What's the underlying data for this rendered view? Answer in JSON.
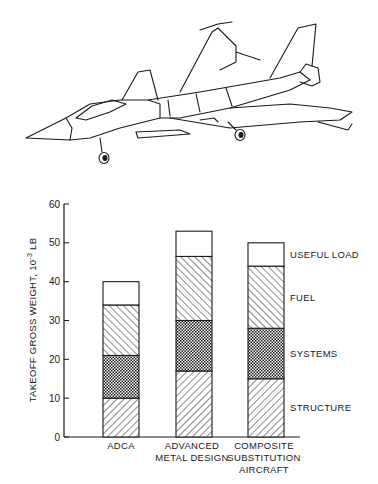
{
  "illustration": {
    "subject": "fighter aircraft line drawing"
  },
  "chart_data": {
    "type": "bar",
    "stacked": true,
    "title": "",
    "xlabel": "",
    "ylabel": "TAKEOFF GROSS WEIGHT, 10",
    "ylabel_exponent": "-3",
    "ylabel_unit": " LB",
    "ylim": [
      0,
      60
    ],
    "yticks": [
      0,
      10,
      20,
      30,
      40,
      50,
      60
    ],
    "grid": false,
    "categories": [
      [
        "ADCA"
      ],
      [
        "ADVANCED",
        "METAL DESIGN"
      ],
      [
        "COMPOSITE",
        "SUBSTITUTION",
        "AIRCRAFT"
      ]
    ],
    "series": [
      {
        "name": "STRUCTURE",
        "pattern": "hatch-forward",
        "values": [
          10,
          17,
          15
        ]
      },
      {
        "name": "SYSTEMS",
        "pattern": "checker",
        "values": [
          11,
          13,
          13
        ]
      },
      {
        "name": "FUEL",
        "pattern": "hatch-back",
        "values": [
          13,
          16.5,
          16
        ]
      },
      {
        "name": "USEFUL LOAD",
        "pattern": "blank",
        "values": [
          6,
          6.5,
          6
        ]
      }
    ],
    "totals": [
      40,
      53,
      50
    ],
    "legend": "right-of-last-bar, labels aligned to segments"
  }
}
